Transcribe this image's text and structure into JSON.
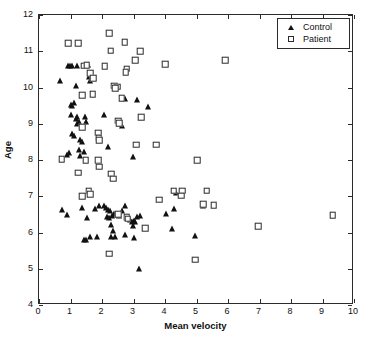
{
  "chart_data": {
    "type": "scatter",
    "title": "",
    "xlabel": "Mean velocity",
    "ylabel": "Age",
    "xlim": [
      0,
      10
    ],
    "ylim": [
      4,
      12
    ],
    "xticks": [
      0,
      1,
      2,
      3,
      4,
      5,
      6,
      7,
      8,
      9,
      10
    ],
    "yticks": [
      4,
      5,
      6,
      7,
      8,
      9,
      10,
      11,
      12
    ],
    "grid": false,
    "legend_position": "top-right",
    "series": [
      {
        "name": "Control",
        "marker": "filled-triangle",
        "color": "#111111",
        "points": [
          [
            0.68,
            10.18
          ],
          [
            0.93,
            10.6
          ],
          [
            0.98,
            10.6
          ],
          [
            1.05,
            10.6
          ],
          [
            1.18,
            10.05
          ],
          [
            1.22,
            10.6
          ],
          [
            1.55,
            10.62
          ],
          [
            1.62,
            10.18
          ],
          [
            1.58,
            10.28
          ],
          [
            1.0,
            9.53
          ],
          [
            1.05,
            9.5
          ],
          [
            1.12,
            9.58
          ],
          [
            1.02,
            9.25
          ],
          [
            1.18,
            9.12
          ],
          [
            1.22,
            9.18
          ],
          [
            1.2,
            9.0
          ],
          [
            1.28,
            9.05
          ],
          [
            1.45,
            9.2
          ],
          [
            1.5,
            9.05
          ],
          [
            2.05,
            9.25
          ],
          [
            2.55,
            8.98
          ],
          [
            2.62,
            8.95
          ],
          [
            2.72,
            9.68
          ],
          [
            3.1,
            9.65
          ],
          [
            3.45,
            9.45
          ],
          [
            1.05,
            8.72
          ],
          [
            1.12,
            8.65
          ],
          [
            1.3,
            8.55
          ],
          [
            1.35,
            8.5
          ],
          [
            1.28,
            8.28
          ],
          [
            1.42,
            8.22
          ],
          [
            0.88,
            8.15
          ],
          [
            0.95,
            8.18
          ],
          [
            1.3,
            8.12
          ],
          [
            2.18,
            8.35
          ],
          [
            2.98,
            8.08
          ],
          [
            0.72,
            6.62
          ],
          [
            0.88,
            6.48
          ],
          [
            1.38,
            6.68
          ],
          [
            1.52,
            6.4
          ],
          [
            1.78,
            6.65
          ],
          [
            1.92,
            6.72
          ],
          [
            2.05,
            6.72
          ],
          [
            2.12,
            6.68
          ],
          [
            2.18,
            6.62
          ],
          [
            2.25,
            6.58
          ],
          [
            2.15,
            6.42
          ],
          [
            2.22,
            6.4
          ],
          [
            2.32,
            6.45
          ],
          [
            2.28,
            6.22
          ],
          [
            2.38,
            6.5
          ],
          [
            2.48,
            6.48
          ],
          [
            2.55,
            6.45
          ],
          [
            2.62,
            6.6
          ],
          [
            2.72,
            6.72
          ],
          [
            2.78,
            6.42
          ],
          [
            2.88,
            6.35
          ],
          [
            2.95,
            6.3
          ],
          [
            3.02,
            6.32
          ],
          [
            3.05,
            6.28
          ],
          [
            3.12,
            6.42
          ],
          [
            3.22,
            6.45
          ],
          [
            2.98,
            6.18
          ],
          [
            2.35,
            6.05
          ],
          [
            1.42,
            5.8
          ],
          [
            1.48,
            5.78
          ],
          [
            1.62,
            5.88
          ],
          [
            1.85,
            5.88
          ],
          [
            2.28,
            5.88
          ],
          [
            2.42,
            5.88
          ],
          [
            2.72,
            5.92
          ],
          [
            3.02,
            5.85
          ],
          [
            4.02,
            6.52
          ],
          [
            4.22,
            6.1
          ],
          [
            4.28,
            6.65
          ],
          [
            4.35,
            7.08
          ],
          [
            4.95,
            5.9
          ],
          [
            5.22,
            6.72
          ],
          [
            3.18,
            5.0
          ]
        ]
      },
      {
        "name": "Patient",
        "marker": "open-square",
        "color": "#2a2a2a",
        "points": [
          [
            2.22,
            11.5
          ],
          [
            0.92,
            11.22
          ],
          [
            1.25,
            11.22
          ],
          [
            2.72,
            11.25
          ],
          [
            2.28,
            11.02
          ],
          [
            3.22,
            11.0
          ],
          [
            5.92,
            10.75
          ],
          [
            3.05,
            10.75
          ],
          [
            4.0,
            10.65
          ],
          [
            1.42,
            10.6
          ],
          [
            1.52,
            10.62
          ],
          [
            2.08,
            10.58
          ],
          [
            2.78,
            10.52
          ],
          [
            2.75,
            10.42
          ],
          [
            1.62,
            10.4
          ],
          [
            1.72,
            10.25
          ],
          [
            2.38,
            10.05
          ],
          [
            2.48,
            10.02
          ],
          [
            2.42,
            9.98
          ],
          [
            1.38,
            9.78
          ],
          [
            1.7,
            9.82
          ],
          [
            2.62,
            9.7
          ],
          [
            3.25,
            9.18
          ],
          [
            2.52,
            9.08
          ],
          [
            2.55,
            9.02
          ],
          [
            1.38,
            8.9
          ],
          [
            1.88,
            8.75
          ],
          [
            1.9,
            8.62
          ],
          [
            1.92,
            8.55
          ],
          [
            3.08,
            8.42
          ],
          [
            3.72,
            8.42
          ],
          [
            0.72,
            8.02
          ],
          [
            1.48,
            8.0
          ],
          [
            1.88,
            8.0
          ],
          [
            5.02,
            8.0
          ],
          [
            1.92,
            7.82
          ],
          [
            1.25,
            7.65
          ],
          [
            2.3,
            7.62
          ],
          [
            2.35,
            7.48
          ],
          [
            1.58,
            7.15
          ],
          [
            4.28,
            7.15
          ],
          [
            4.55,
            7.15
          ],
          [
            5.32,
            7.15
          ],
          [
            1.38,
            7.0
          ],
          [
            1.62,
            7.05
          ],
          [
            4.52,
            7.02
          ],
          [
            3.82,
            6.9
          ],
          [
            5.22,
            6.78
          ],
          [
            5.55,
            6.75
          ],
          [
            9.32,
            6.48
          ],
          [
            2.52,
            6.5
          ],
          [
            2.78,
            6.42
          ],
          [
            2.82,
            6.38
          ],
          [
            3.38,
            6.12
          ],
          [
            6.95,
            6.18
          ],
          [
            2.22,
            5.42
          ],
          [
            4.95,
            5.25
          ]
        ]
      }
    ]
  },
  "legend": {
    "items": [
      {
        "label": "Control",
        "marker": "filled-triangle"
      },
      {
        "label": "Patient",
        "marker": "open-square"
      }
    ]
  }
}
